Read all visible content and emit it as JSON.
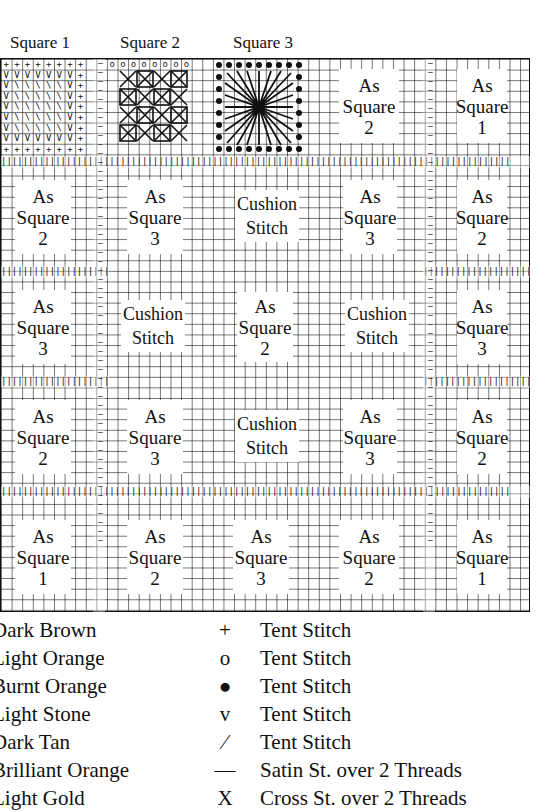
{
  "headings": {
    "square1": "Square 1",
    "square2": "Square 2",
    "square3": "Square 3"
  },
  "chart": {
    "columns": 5,
    "rows": 5,
    "blocks": [
      [
        {
          "type": "square1",
          "border": "+",
          "fill": "diagonal-v"
        },
        {
          "type": "square2",
          "border": "o",
          "fill": "cross-grid"
        },
        {
          "type": "square3",
          "border": "●",
          "fill": "star"
        },
        {
          "type": "label",
          "border": "o",
          "lines": [
            "As",
            "Square",
            "2"
          ]
        },
        {
          "type": "label",
          "border": "+",
          "lines": [
            "As",
            "Square",
            "1"
          ]
        }
      ],
      [
        {
          "type": "label",
          "border": "o",
          "lines": [
            "As",
            "Square",
            "2"
          ]
        },
        {
          "type": "label",
          "border": "●",
          "lines": [
            "As",
            "Square",
            "3"
          ]
        },
        {
          "type": "cushion",
          "border": "v",
          "lines": [
            "Cushion",
            "Stitch"
          ]
        },
        {
          "type": "label",
          "border": "●",
          "lines": [
            "As",
            "Square",
            "3"
          ]
        },
        {
          "type": "label",
          "border": "o",
          "lines": [
            "As",
            "Square",
            "2"
          ]
        }
      ],
      [
        {
          "type": "label",
          "border": "●",
          "lines": [
            "As",
            "Square",
            "3"
          ]
        },
        {
          "type": "cushion",
          "border": "v",
          "lines": [
            "Cushion",
            "Stitch"
          ]
        },
        {
          "type": "label",
          "border": "+",
          "lines": [
            "As",
            "Square",
            "2"
          ]
        },
        {
          "type": "cushion",
          "border": "v",
          "lines": [
            "Cushion",
            "Stitch"
          ]
        },
        {
          "type": "label",
          "border": "●",
          "lines": [
            "As",
            "Square",
            "3"
          ]
        }
      ],
      [
        {
          "type": "label",
          "border": "o",
          "lines": [
            "As",
            "Square",
            "2"
          ]
        },
        {
          "type": "label",
          "border": "●",
          "lines": [
            "As",
            "Square",
            "3"
          ]
        },
        {
          "type": "cushion",
          "border": "v",
          "lines": [
            "Cushion",
            "Stitch"
          ]
        },
        {
          "type": "label",
          "border": "●",
          "lines": [
            "As",
            "Square",
            "3"
          ]
        },
        {
          "type": "label",
          "border": "o",
          "lines": [
            "As",
            "Square",
            "2"
          ]
        }
      ],
      [
        {
          "type": "label",
          "border": "+",
          "lines": [
            "As",
            "Square",
            "1"
          ]
        },
        {
          "type": "label",
          "border": "o",
          "lines": [
            "As",
            "Square",
            "2"
          ]
        },
        {
          "type": "label",
          "border": "●",
          "lines": [
            "As",
            "Square",
            "3"
          ]
        },
        {
          "type": "label",
          "border": "o",
          "lines": [
            "As",
            "Square",
            "2"
          ]
        },
        {
          "type": "label",
          "border": "+",
          "lines": [
            "As",
            "Square",
            "1"
          ]
        }
      ]
    ],
    "cell_labels": {
      "r0c3": [
        "As",
        "Square",
        "2"
      ],
      "r0c4": [
        "As",
        "Square",
        "1"
      ],
      "r1c0": [
        "As",
        "Square",
        "2"
      ],
      "r1c1": [
        "As",
        "Square",
        "3"
      ],
      "r1c2": [
        "Cushion",
        "Stitch"
      ],
      "r1c3": [
        "As",
        "Square",
        "3"
      ],
      "r1c4": [
        "As",
        "Square",
        "2"
      ],
      "r2c0": [
        "As",
        "Square",
        "3"
      ],
      "r2c1": [
        "Cushion",
        "Stitch"
      ],
      "r2c2": [
        "As",
        "Square",
        "2"
      ],
      "r2c3": [
        "Cushion",
        "Stitch"
      ],
      "r2c4": [
        "As",
        "Square",
        "3"
      ],
      "r3c0": [
        "As",
        "Square",
        "2"
      ],
      "r3c1": [
        "As",
        "Square",
        "3"
      ],
      "r3c2": [
        "Cushion",
        "Stitch"
      ],
      "r3c3": [
        "As",
        "Square",
        "3"
      ],
      "r3c4": [
        "As",
        "Square",
        "2"
      ],
      "r4c0": [
        "As",
        "Square",
        "1"
      ],
      "r4c1": [
        "As",
        "Square",
        "2"
      ],
      "r4c2": [
        "As",
        "Square",
        "3"
      ],
      "r4c3": [
        "As",
        "Square",
        "2"
      ],
      "r4c4": [
        "As",
        "Square",
        "1"
      ]
    },
    "symbols": {
      "tent_dark_brown": "+",
      "tent_light_orange": "o",
      "tent_burnt_orange": "●",
      "tent_light_stone": "v",
      "tent_dark_tan": "/",
      "satin_brilliant_orange": "—",
      "cross_light_gold": "X",
      "satin_vertical": "|"
    }
  },
  "legend": [
    {
      "color": "Dark Brown",
      "symbol": "+",
      "stitch": "Tent Stitch"
    },
    {
      "color": "Light Orange",
      "symbol": "o",
      "stitch": "Tent Stitch"
    },
    {
      "color": "Burnt Orange",
      "symbol": "●",
      "stitch": "Tent Stitch"
    },
    {
      "color": "Light Stone",
      "symbol": "v",
      "stitch": "Tent Stitch"
    },
    {
      "color": "Dark Tan",
      "symbol": "⁄",
      "stitch": "Tent Stitch"
    },
    {
      "color": "Brilliant Orange",
      "symbol": "—",
      "stitch": "Satin St. over 2 Threads"
    },
    {
      "color": "Light Gold",
      "symbol": "X",
      "stitch": "Cross St. over 2 Threads"
    }
  ]
}
